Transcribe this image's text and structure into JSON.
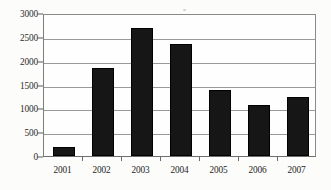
{
  "chart_data": {
    "type": "bar",
    "title": "",
    "subtitle": "",
    "xlabel": "",
    "ylabel": "",
    "categories": [
      "2001",
      "2002",
      "2003",
      "2004",
      "2005",
      "2006",
      "2007"
    ],
    "values": [
      220,
      1870,
      2700,
      2370,
      1400,
      1100,
      1250
    ],
    "series": [
      {
        "name": "",
        "values": [
          220,
          1870,
          2700,
          2370,
          1400,
          1100,
          1250
        ]
      }
    ],
    "ylim": [
      0,
      3000
    ],
    "ytick_labels": [
      "0",
      "500",
      "1000",
      "1500",
      "2000",
      "2500",
      "3000"
    ],
    "ytick_values": [
      0,
      500,
      1000,
      1500,
      2000,
      2500,
      3000
    ],
    "xtick_labels": [
      "2001",
      "2002",
      "2003",
      "2004",
      "2005",
      "2006",
      "2007"
    ],
    "grid": true,
    "grid_axis": "y",
    "legend": false,
    "legend_position": "none",
    "bar_color": "#161616",
    "gridline_color": "#9a9a9a",
    "axis_color": "#6e6e6e",
    "background_color": "#fcfcfa",
    "annotations": []
  }
}
